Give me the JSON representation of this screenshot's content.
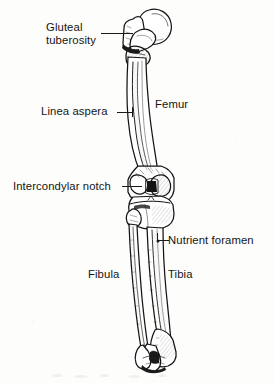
{
  "figure": {
    "width": 274,
    "height": 383,
    "background_color": "#fdfdfc",
    "ink_color": "#151515",
    "style": "black-and-white line drawing / engraving"
  },
  "labels": {
    "gluteal_tuberosity": "Gluteal\ntuberosity",
    "linea_aspera": "Linea aspera",
    "femur": "Femur",
    "intercondylar_notch": "Intercondylar notch",
    "nutrient_foramen": "Nutrient foramen",
    "fibula": "Fibula",
    "tibia": "Tibia"
  },
  "structures": [
    {
      "name": "femur",
      "label": "Femur",
      "has_leader_line": false,
      "region": "thigh",
      "features": [
        "head",
        "neck",
        "greater trochanter",
        "lesser trochanter",
        "shaft",
        "condyles"
      ]
    },
    {
      "name": "gluteal-tuberosity",
      "label": "Gluteal tuberosity",
      "has_leader_line": true,
      "region": "proximal posterior femur"
    },
    {
      "name": "linea-aspera",
      "label": "Linea aspera",
      "has_leader_line": true,
      "region": "femoral shaft ridge"
    },
    {
      "name": "intercondylar-notch",
      "label": "Intercondylar notch",
      "has_leader_line": true,
      "region": "distal femur between condyles"
    },
    {
      "name": "nutrient-foramen",
      "label": "Nutrient foramen",
      "has_leader_line": true,
      "region": "proximal tibia"
    },
    {
      "name": "tibia",
      "label": "Tibia",
      "has_leader_line": false,
      "region": "leg, medial / larger bone"
    },
    {
      "name": "fibula",
      "label": "Fibula",
      "has_leader_line": false,
      "region": "leg, lateral / slender bone"
    }
  ]
}
